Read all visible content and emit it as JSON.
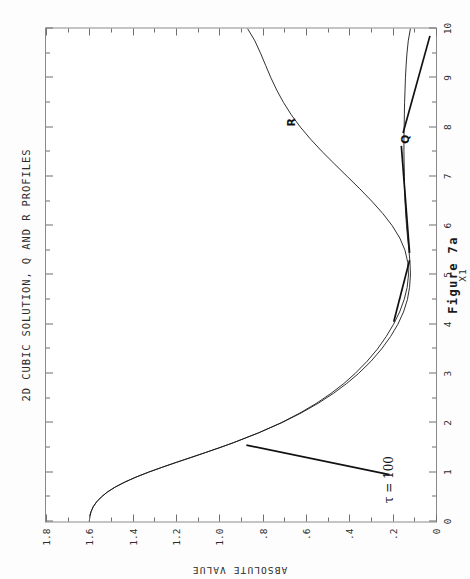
{
  "figure": {
    "title": "2D CUBIC SOLUTION, Q AND R PROFILES",
    "caption": "Figure 7a"
  },
  "chart_data": {
    "type": "line",
    "title": "2D CUBIC SOLUTION, Q AND R PROFILES",
    "xlabel": "X1",
    "ylabel": "ABSOLUTE VALUE",
    "xlim": [
      0,
      10
    ],
    "ylim": [
      0,
      1.8
    ],
    "grid": false,
    "legend_position": "inline-labels",
    "xticks": [
      0,
      1,
      2,
      3,
      4,
      5,
      6,
      7,
      8,
      9,
      10
    ],
    "xticklabels": [
      "0",
      "1",
      "2",
      "3",
      "4",
      "5",
      "6",
      "7",
      "8",
      "9",
      "10"
    ],
    "yticks": [
      0,
      0.2,
      0.4,
      0.6,
      0.8,
      1.0,
      1.2,
      1.4,
      1.6,
      1.8
    ],
    "yticklabels": [
      "0",
      ".2",
      ".4",
      ".6",
      ".8",
      "1.0",
      "1.2",
      "1.4",
      "1.6",
      "1.8"
    ],
    "x_minor_tick_step": 0.5,
    "y_minor_tick_step": 0.1,
    "annotations": [
      {
        "text": "R",
        "x": 8.1,
        "y": 0.67
      },
      {
        "text": "Q",
        "x": 7.75,
        "y": 0.145
      },
      {
        "text": "τ = 100",
        "x": 0.85,
        "y": 0.215
      }
    ],
    "series": [
      {
        "name": "R",
        "label": "R",
        "x": [
          0.0,
          0.1,
          0.2,
          0.3,
          0.4,
          0.5,
          0.6,
          0.7,
          0.8,
          0.9,
          1.0,
          1.1,
          1.2,
          1.3,
          1.4,
          1.5,
          1.6,
          1.8,
          2.0,
          2.2,
          2.4,
          2.6,
          2.8,
          3.0,
          3.25,
          3.5,
          3.75,
          4.0,
          4.25,
          4.5,
          4.75,
          5.0,
          5.25,
          5.5,
          5.75,
          6.0,
          6.25,
          6.5,
          6.75,
          7.0,
          7.25,
          7.5,
          7.75,
          8.0,
          8.25,
          8.5,
          8.75,
          9.0,
          9.25,
          9.5,
          9.75,
          10.0
        ],
        "y": [
          1.6,
          1.598,
          1.592,
          1.582,
          1.566,
          1.544,
          1.516,
          1.48,
          1.436,
          1.385,
          1.327,
          1.264,
          1.198,
          1.13,
          1.063,
          0.997,
          0.934,
          0.818,
          0.716,
          0.628,
          0.551,
          0.484,
          0.425,
          0.374,
          0.318,
          0.27,
          0.23,
          0.196,
          0.168,
          0.147,
          0.133,
          0.127,
          0.13,
          0.143,
          0.167,
          0.202,
          0.246,
          0.297,
          0.352,
          0.41,
          0.468,
          0.525,
          0.578,
          0.626,
          0.668,
          0.704,
          0.735,
          0.762,
          0.786,
          0.81,
          0.836,
          0.87
        ]
      },
      {
        "name": "Q",
        "label": "Q",
        "x": [
          0.0,
          0.1,
          0.2,
          0.3,
          0.4,
          0.5,
          0.6,
          0.7,
          0.8,
          0.9,
          1.0,
          1.1,
          1.2,
          1.3,
          1.4,
          1.5,
          1.6,
          1.8,
          2.0,
          2.2,
          2.4,
          2.6,
          2.8,
          3.0,
          3.25,
          3.5,
          3.75,
          4.0,
          4.25,
          4.5,
          4.75,
          5.0,
          5.25,
          5.5,
          5.75,
          6.0,
          6.25,
          6.5,
          6.75,
          7.0,
          7.25,
          7.5,
          7.75,
          8.0,
          8.25,
          8.5,
          8.75,
          9.0,
          9.25,
          9.5,
          9.75,
          10.0
        ],
        "y": [
          1.6,
          1.598,
          1.592,
          1.582,
          1.566,
          1.544,
          1.516,
          1.48,
          1.436,
          1.385,
          1.327,
          1.264,
          1.198,
          1.13,
          1.063,
          0.997,
          0.934,
          0.818,
          0.714,
          0.623,
          0.543,
          0.473,
          0.412,
          0.358,
          0.3,
          0.251,
          0.21,
          0.176,
          0.15,
          0.132,
          0.122,
          0.118,
          0.12,
          0.125,
          0.131,
          0.136,
          0.14,
          0.143,
          0.145,
          0.146,
          0.147,
          0.148,
          0.148,
          0.147,
          0.146,
          0.145,
          0.143,
          0.141,
          0.138,
          0.134,
          0.128,
          0.118
        ]
      }
    ],
    "leader_lines": [
      {
        "name": "tau-leader",
        "x1": 0.95,
        "y1": 0.215,
        "x2": 1.55,
        "y2": 0.875
      },
      {
        "name": "q-leader-lower",
        "x1": 4.05,
        "y1": 0.195,
        "x2": 5.3,
        "y2": 0.122
      },
      {
        "name": "q-leader-upper",
        "x1": 5.45,
        "y1": 0.122,
        "x2": 7.62,
        "y2": 0.16
      },
      {
        "name": "q-leader-tail",
        "x1": 7.88,
        "y1": 0.152,
        "x2": 9.85,
        "y2": 0.028
      }
    ]
  }
}
